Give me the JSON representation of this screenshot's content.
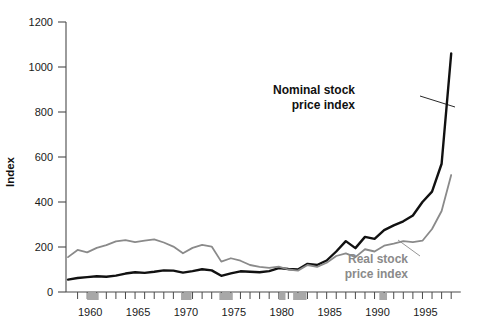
{
  "chart_data": {
    "type": "line",
    "title": "",
    "subtitle": "",
    "xlabel": "",
    "ylabel": "Index",
    "ylim": [
      0,
      1200
    ],
    "xlim": [
      1958,
      1999
    ],
    "yticks": [
      0,
      200,
      400,
      600,
      800,
      1000,
      1200
    ],
    "ytick_labels": [
      "0",
      "200",
      "400",
      "600",
      "800",
      "1000",
      "1200"
    ],
    "xticks": [
      1960,
      1965,
      1970,
      1975,
      1980,
      1985,
      1990,
      1995
    ],
    "xtick_labels": [
      "1960",
      "1965",
      "1970",
      "1975",
      "1980",
      "1985",
      "1990",
      "1995"
    ],
    "minor_xtick_interval": 1,
    "grid": false,
    "legend_position": "inline-annotation",
    "recession_bands": [
      {
        "start": 1960.0,
        "end": 1961.2
      },
      {
        "start": 1969.8,
        "end": 1970.9
      },
      {
        "start": 1973.8,
        "end": 1975.2
      },
      {
        "start": 1980.0,
        "end": 1980.7
      },
      {
        "start": 1981.5,
        "end": 1982.9
      },
      {
        "start": 1990.5,
        "end": 1991.3
      }
    ],
    "x": [
      1958,
      1959,
      1960,
      1961,
      1962,
      1963,
      1964,
      1965,
      1966,
      1967,
      1968,
      1969,
      1970,
      1971,
      1972,
      1973,
      1974,
      1975,
      1976,
      1977,
      1978,
      1979,
      1980,
      1981,
      1982,
      1983,
      1984,
      1985,
      1986,
      1987,
      1988,
      1989,
      1990,
      1991,
      1992,
      1993,
      1994,
      1995,
      1996,
      1997,
      1998
    ],
    "series": [
      {
        "name": "Nominal stock price index",
        "color": "#111111",
        "values": [
          55,
          62,
          66,
          70,
          68,
          73,
          82,
          88,
          85,
          90,
          96,
          95,
          86,
          93,
          101,
          96,
          72,
          83,
          92,
          90,
          88,
          93,
          106,
          102,
          100,
          125,
          120,
          140,
          180,
          226,
          195,
          245,
          236,
          275,
          296,
          314,
          340,
          400,
          446,
          570,
          1060
        ]
      },
      {
        "name": "Real stock price index",
        "color": "#8a8a8a",
        "values": [
          155,
          187,
          176,
          196,
          208,
          225,
          231,
          222,
          228,
          234,
          220,
          202,
          172,
          196,
          209,
          202,
          135,
          150,
          139,
          120,
          112,
          107,
          113,
          100,
          95,
          120,
          112,
          130,
          160,
          172,
          155,
          190,
          180,
          206,
          215,
          226,
          222,
          228,
          280,
          360,
          520
        ]
      }
    ],
    "annotations": [
      {
        "id": "nominal-annotation",
        "text_line1": "Nominal stock",
        "text_line2": "price index",
        "color": "#111111",
        "text_x": 355,
        "text_y": 94,
        "leader_from_x": 420,
        "leader_from_y": 96,
        "leader_to_x": 455,
        "leader_to_y": 107
      },
      {
        "id": "real-annotation",
        "text_line1": "Real stock",
        "text_line2": "price index",
        "color": "#8a8a8a",
        "text_x": 408,
        "text_y": 263,
        "leader_from_x": 420,
        "leader_from_y": 256,
        "leader_to_x": 398,
        "leader_to_y": 240
      }
    ],
    "colors": {
      "nominal": "#111111",
      "real": "#8a8a8a",
      "axis": "#4a4a4a",
      "recession_band": "#a8a8a8",
      "background": "#ffffff"
    }
  }
}
